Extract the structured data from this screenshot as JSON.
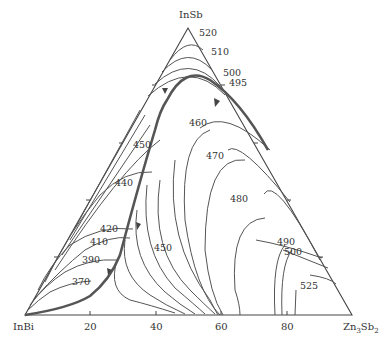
{
  "diagram": {
    "type": "ternary liquidus projection",
    "vertices": {
      "top": "InSb",
      "left": "InBi",
      "right": "Zn3Sb2",
      "right_main": "Zn",
      "right_sub1": "3",
      "right_mid": "Sb",
      "right_sub2": "2"
    },
    "bottom_axis_ticks": [
      "20",
      "40",
      "60",
      "80"
    ],
    "isotherm_labels": [
      {
        "value": "520"
      },
      {
        "value": "510"
      },
      {
        "value": "500"
      },
      {
        "value": "495"
      },
      {
        "value": "460"
      },
      {
        "value": "470"
      },
      {
        "value": "480"
      },
      {
        "value": "450"
      },
      {
        "value": "440"
      },
      {
        "value": "420"
      },
      {
        "value": "410"
      },
      {
        "value": "390"
      },
      {
        "value": "370"
      },
      {
        "value": "450"
      },
      {
        "value": "490"
      },
      {
        "value": "500"
      },
      {
        "value": "525"
      }
    ],
    "colors": {
      "lines": "#555555",
      "frame": "#444444",
      "text": "#333333"
    }
  }
}
